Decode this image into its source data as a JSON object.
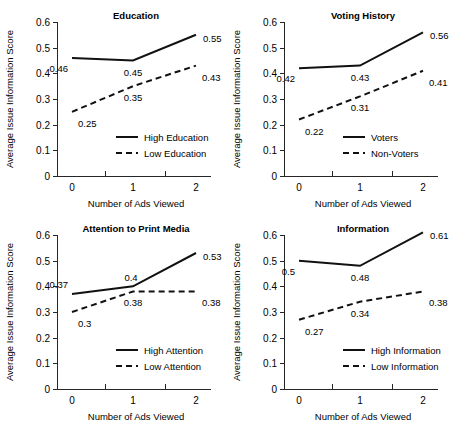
{
  "figure": {
    "panel_count": 4,
    "shared_ylabel": "Average Issue Information Score",
    "shared_xlabel": "Number of Ads Viewed",
    "y_ticks": [
      "0",
      "0.1",
      "0.2",
      "0.3",
      "0.4",
      "0.5",
      "0.6"
    ],
    "x_ticks": [
      "0",
      "1",
      "2"
    ],
    "line_color": "#111111",
    "axis_color": "#262626"
  },
  "chart_data": [
    {
      "type": "line",
      "title": "Education",
      "xlabel": "Number of Ads Viewed",
      "ylabel": "Average Issue Information Score",
      "x": [
        0,
        1,
        2
      ],
      "xticklabels": [
        "0",
        "1",
        "2"
      ],
      "ylim": [
        0,
        0.6
      ],
      "yticks": [
        0,
        0.1,
        0.2,
        0.3,
        0.4,
        0.5,
        0.6
      ],
      "grid": false,
      "legend_position": "lower right inside axes",
      "series": [
        {
          "name": "High Education",
          "style": "solid",
          "values": [
            0.46,
            0.45,
            0.55
          ],
          "labels": [
            "0.46",
            "0.45",
            "0.55"
          ],
          "label_pos": [
            "below-left",
            "below",
            "right"
          ]
        },
        {
          "name": "Low Education",
          "style": "dashed",
          "values": [
            0.25,
            0.35,
            0.43
          ],
          "labels": [
            "0.25",
            "0.35",
            "0.43"
          ],
          "label_pos": [
            "below-right",
            "below",
            "below-right"
          ]
        }
      ]
    },
    {
      "type": "line",
      "title": "Voting History",
      "xlabel": "Number of Ads Viewed",
      "ylabel": "Average Issue Information Score",
      "x": [
        0,
        1,
        2
      ],
      "xticklabels": [
        "0",
        "1",
        "2"
      ],
      "ylim": [
        0,
        0.6
      ],
      "yticks": [
        0,
        0.1,
        0.2,
        0.3,
        0.4,
        0.5,
        0.6
      ],
      "grid": false,
      "legend_position": "lower right inside axes",
      "series": [
        {
          "name": "Voters",
          "style": "solid",
          "values": [
            0.42,
            0.43,
            0.56
          ],
          "labels": [
            "0.42",
            "0.43",
            "0.56"
          ],
          "label_pos": [
            "below-left",
            "below",
            "right"
          ]
        },
        {
          "name": "Non-Voters",
          "style": "dashed",
          "values": [
            0.22,
            0.31,
            0.41
          ],
          "labels": [
            "0.22",
            "0.31",
            "0.41"
          ],
          "label_pos": [
            "below-right",
            "below",
            "below-right"
          ]
        }
      ]
    },
    {
      "type": "line",
      "title": "Attention to Print Media",
      "xlabel": "Number of Ads Viewed",
      "ylabel": "Average Issue Information Score",
      "x": [
        0,
        1,
        2
      ],
      "xticklabels": [
        "0",
        "1",
        "2"
      ],
      "ylim": [
        0,
        0.6
      ],
      "yticks": [
        0,
        0.1,
        0.2,
        0.3,
        0.4,
        0.5,
        0.6
      ],
      "grid": false,
      "legend_position": "lower right inside axes",
      "series": [
        {
          "name": "High Attention",
          "style": "solid",
          "values": [
            0.37,
            0.4,
            0.53
          ],
          "labels": [
            "0.37",
            "0.4",
            "0.53"
          ],
          "label_pos": [
            "above-left",
            "above",
            "right"
          ]
        },
        {
          "name": "Low Attention",
          "style": "dashed",
          "values": [
            0.3,
            0.38,
            0.38
          ],
          "labels": [
            "0.3",
            "0.38",
            "0.38"
          ],
          "label_pos": [
            "below-right",
            "below",
            "below-right"
          ]
        }
      ]
    },
    {
      "type": "line",
      "title": "Information",
      "xlabel": "Number of Ads Viewed",
      "ylabel": "Average Issue Information Score",
      "x": [
        0,
        1,
        2
      ],
      "xticklabels": [
        "0",
        "1",
        "2"
      ],
      "ylim": [
        0,
        0.6
      ],
      "yticks": [
        0,
        0.1,
        0.2,
        0.3,
        0.4,
        0.5,
        0.6
      ],
      "grid": false,
      "legend_position": "lower right inside axes",
      "series": [
        {
          "name": "High Information",
          "style": "solid",
          "values": [
            0.5,
            0.48,
            0.61
          ],
          "labels": [
            "0.5",
            "0.48",
            "0.61"
          ],
          "label_pos": [
            "below-left",
            "below",
            "right"
          ]
        },
        {
          "name": "Low Information",
          "style": "dashed",
          "values": [
            0.27,
            0.34,
            0.38
          ],
          "labels": [
            "0.27",
            "0.34",
            "0.38"
          ],
          "label_pos": [
            "below-right",
            "below",
            "below-right"
          ]
        }
      ]
    }
  ]
}
